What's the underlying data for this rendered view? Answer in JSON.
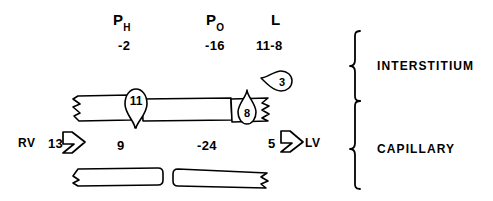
{
  "figure": {
    "headers": [
      {
        "symbol": "P",
        "subscript": "H",
        "value": "-2"
      },
      {
        "symbol": "P",
        "subscript": "O",
        "value": "-16"
      },
      {
        "symbol": "L",
        "subscript": "",
        "value": "11-8"
      }
    ],
    "flows": {
      "inflow_vessel": "RV",
      "inflow_value": "13",
      "outflow_value": "5",
      "outflow_vessel": "LV",
      "capillary_hydrostatic": "9",
      "capillary_oncotic": "-24"
    },
    "droplets": {
      "down_arrow_value": "11",
      "up_arrow_value": "8",
      "lymph_value": "3"
    },
    "braces": {
      "top_label": "INTERSTITIUM",
      "bottom_label": "CAPILLARY"
    },
    "colors": {
      "ink": "#000000",
      "background": "#ffffff"
    }
  }
}
